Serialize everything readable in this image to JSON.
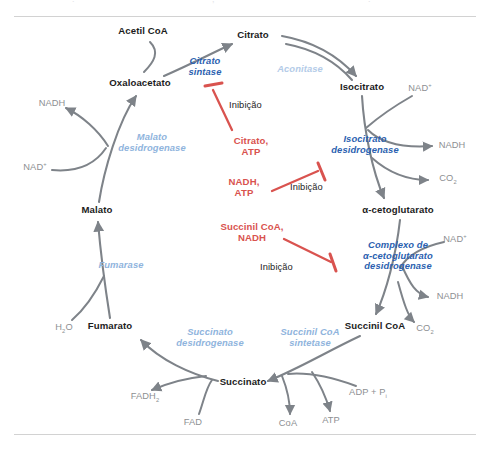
{
  "figure": {
    "kind": "krebs-cycle-diagram",
    "language": "pt-BR",
    "colors": {
      "metabolite": "#1c1c1c",
      "cofactor": "#8d8f92",
      "enzyme_blue": "#2b5fb0",
      "enzyme_blue_pale": "#b3cbe8",
      "enzyme_blue_mid": "#8fb4dd",
      "inhibitor_red": "#d9534f",
      "arrow_grey": "#7e8389",
      "rule_grey": "#d2d2d2",
      "background": "#ffffff"
    }
  },
  "metabolites": [
    {
      "id": "acetil-coa",
      "label": "Acetil CoA",
      "style": "cofactor",
      "x": 143,
      "y": 32,
      "align": "center"
    },
    {
      "id": "citrato",
      "label": "Citrato",
      "style": "metabolite",
      "x": 253,
      "y": 36,
      "align": "center"
    },
    {
      "id": "oxaloacetato",
      "label": "Oxaloacetato",
      "style": "metabolite",
      "x": 140,
      "y": 84,
      "align": "center"
    },
    {
      "id": "isocitrato",
      "label": "Isocitrato",
      "style": "metabolite",
      "x": 362,
      "y": 88,
      "align": "center"
    },
    {
      "id": "alfa-cetoglutarato",
      "label": "α-cetoglutarato",
      "style": "metabolite",
      "x": 398,
      "y": 211,
      "align": "center"
    },
    {
      "id": "malato",
      "label": "Malato",
      "style": "metabolite",
      "x": 97,
      "y": 211,
      "align": "center"
    },
    {
      "id": "succinil-coa",
      "label": "Succinil CoA",
      "style": "metabolite",
      "x": 375,
      "y": 327,
      "align": "center"
    },
    {
      "id": "fumarato",
      "label": "Fumarato",
      "style": "metabolite",
      "x": 110,
      "y": 327,
      "align": "center"
    },
    {
      "id": "succinato",
      "label": "Succinato",
      "style": "metabolite",
      "x": 243,
      "y": 383,
      "align": "center"
    }
  ],
  "cofactors": [
    {
      "id": "nadh-malato-deh",
      "label": "NADH",
      "x": 52,
      "y": 104,
      "align": "center"
    },
    {
      "id": "nad-malato-deh",
      "label": "NAD+",
      "html": "NAD<sup>+</sup>",
      "x": 35,
      "y": 168,
      "align": "center"
    },
    {
      "id": "nad-isocitrato",
      "label": "NAD+",
      "html": "NAD<sup>+</sup>",
      "x": 420,
      "y": 89,
      "align": "center"
    },
    {
      "id": "nadh-isocitrato",
      "label": "NADH",
      "x": 452,
      "y": 146,
      "align": "center"
    },
    {
      "id": "co2-isocitrato",
      "label": "CO2",
      "html": "CO<sub>2</sub>",
      "x": 448,
      "y": 179,
      "align": "center"
    },
    {
      "id": "nad-cetoglut",
      "label": "NAD+",
      "html": "NAD<sup>+</sup>",
      "x": 455,
      "y": 240,
      "align": "center"
    },
    {
      "id": "nadh-cetoglut",
      "label": "NADH",
      "x": 450,
      "y": 297,
      "align": "center"
    },
    {
      "id": "co2-cetoglut",
      "label": "CO2",
      "html": "CO<sub>2</sub>",
      "x": 425,
      "y": 329,
      "align": "center"
    },
    {
      "id": "h2o-fumarase",
      "label": "H2O",
      "html": "H<sub>2</sub>O",
      "x": 64,
      "y": 328,
      "align": "center"
    },
    {
      "id": "fadh2",
      "label": "FADH2",
      "html": "FADH<sub>2</sub>",
      "x": 145,
      "y": 397,
      "align": "center"
    },
    {
      "id": "fad",
      "label": "FAD",
      "x": 193,
      "y": 423,
      "align": "center"
    },
    {
      "id": "adp-pi",
      "label": "ADP + Pi",
      "html": "ADP + P<sub>i</sub>",
      "x": 368,
      "y": 393,
      "align": "center"
    },
    {
      "id": "coa",
      "label": "CoA",
      "x": 288,
      "y": 424,
      "align": "center"
    },
    {
      "id": "atp-sintetase",
      "label": "ATP",
      "x": 331,
      "y": 421,
      "align": "center"
    }
  ],
  "enzymes": [
    {
      "id": "citrato-sintase",
      "lines": [
        "Citrato",
        "sintase"
      ],
      "tone": "strong",
      "x": 205,
      "y": 62,
      "align": "center"
    },
    {
      "id": "aconitase",
      "lines": [
        "Aconitase"
      ],
      "tone": "pale",
      "x": 300,
      "y": 70,
      "align": "center"
    },
    {
      "id": "isocitrato-desidrogenase",
      "lines": [
        "Isocitrato",
        "desidrogenase"
      ],
      "tone": "strong",
      "x": 365,
      "y": 140,
      "align": "center"
    },
    {
      "id": "complexo-cetoglutarato-desidrogenase",
      "lines": [
        "Complexo de",
        "α-cetoglutarato",
        "desidrogenase"
      ],
      "tone": "strong",
      "x": 398,
      "y": 251,
      "align": "center"
    },
    {
      "id": "malato-desidrogenase",
      "lines": [
        "Malato",
        "desidrogenase"
      ],
      "tone": "mid",
      "x": 152,
      "y": 138,
      "align": "center"
    },
    {
      "id": "fumarase",
      "lines": [
        "Fumarase"
      ],
      "tone": "mid",
      "x": 121,
      "y": 266,
      "align": "center"
    },
    {
      "id": "succinato-desidrogenase",
      "lines": [
        "Succinato",
        "desidrogenase"
      ],
      "tone": "mid",
      "x": 210,
      "y": 333,
      "align": "center"
    },
    {
      "id": "succinil-coa-sintetase",
      "lines": [
        "Succinil CoA",
        "sintetase"
      ],
      "tone": "mid",
      "x": 310,
      "y": 333,
      "align": "center"
    }
  ],
  "inhibitors": [
    {
      "id": "inibicao-citrato-sintase",
      "molecules": [
        "Citrato,",
        "ATP"
      ],
      "word": "Inibição",
      "mol_x": 251,
      "mol_y": 142,
      "word_x": 229,
      "word_y": 104,
      "target": "citrato-sintase"
    },
    {
      "id": "inibicao-isocitrato-desidrogenase",
      "molecules": [
        "NADH,",
        "ATP"
      ],
      "word": "Inibição",
      "mol_x": 244,
      "mol_y": 183,
      "word_x": 290,
      "word_y": 186,
      "target": "isocitrato-desidrogenase"
    },
    {
      "id": "inibicao-complexo-cetoglutarato",
      "molecules": [
        "Succinil CoA,",
        "NADH"
      ],
      "word": "Inibição",
      "mol_x": 252,
      "mol_y": 228,
      "word_x": 260,
      "word_y": 266,
      "target": "complexo-cetoglutarato-desidrogenase"
    }
  ],
  "rules": {
    "top_label": "",
    "bottom_label": ""
  }
}
